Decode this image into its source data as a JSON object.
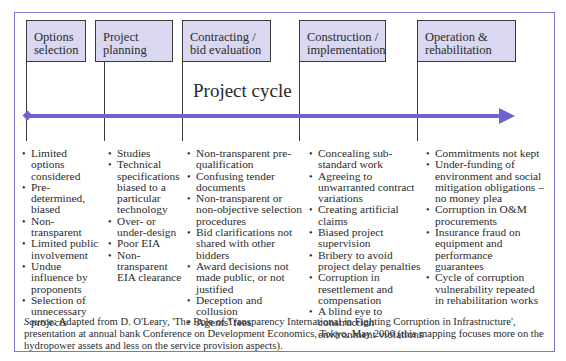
{
  "diagram": {
    "title": "Project cycle",
    "colors": {
      "frame_border": "#7f74cc",
      "phase_fill": "#d9d8f0",
      "phase_border": "#3a3a3a",
      "arrow": "#6f64cf",
      "text": "#2b2b2b"
    },
    "phases": [
      {
        "label_line1": "Options",
        "label_line2": "selection",
        "items": [
          "Limited options considered",
          "Pre-determined, biased",
          "Non-transparent",
          "Limited public involvement",
          "Undue influence by proponents",
          "Selection of unnecessary projects"
        ]
      },
      {
        "label_line1": "Project",
        "label_line2": "planning",
        "items": [
          "Studies",
          "Technical specifications biased to a particular technology",
          "Over- or under-design",
          "Poor EIA",
          "Non-transparent EIA clearance"
        ]
      },
      {
        "label_line1": "Contracting /",
        "label_line2": "bid evaluation",
        "items": [
          "Non-transparent pre-qualification",
          "Confusing tender documents",
          "Non-transparent or non-objective selection procedures",
          "Bid clarifications not shared with other bidders",
          "Award decisions not made public, or not justified",
          "Deception and collusion",
          "Agents' fees"
        ]
      },
      {
        "label_line1": "Construction /",
        "label_line2": "implementation",
        "items": [
          "Concealing sub-standard work",
          "Agreeing to unwarranted contract variations",
          "Creating artificial claims",
          "Biased project supervision",
          "Bribery to avoid project delay penalties",
          "Corruption in resettlement and compensation",
          "A blind eye to construction environment violations"
        ]
      },
      {
        "label_line1": "Operation &",
        "label_line2": "rehabilitation",
        "items": [
          "Commitments not kept",
          "Under-funding of environment and social mitigation obligations – no money plea",
          "Corruption in O&M procurements",
          "Insurance fraud on equipment and performance guarantees",
          "Cycle of corruption vulnerability repeated in rehabilitation works"
        ]
      }
    ],
    "source": {
      "label": "Source:",
      "text": " Adapted from D. O'Leary, 'The Role of Transparency International in Fighting Corruption in Infrastructure', presentation at annual bank Conference on Development Economics, Tokyo, May 2006 (this mapping focuses more on the hydropower assets and less on the service provision aspects)."
    }
  }
}
